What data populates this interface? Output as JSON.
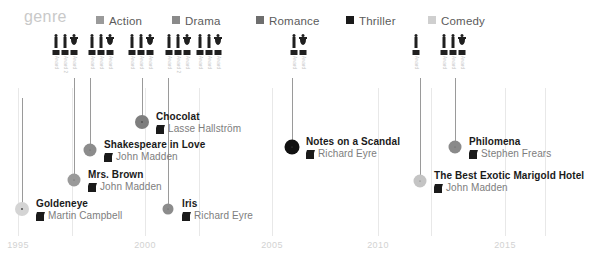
{
  "legend": {
    "title": "genre",
    "items": [
      {
        "label": "Action",
        "color": "#9a9a9a",
        "x": 96
      },
      {
        "label": "Drama",
        "color": "#8a8a8a",
        "x": 172
      },
      {
        "label": "Romance",
        "color": "#6e6e6e",
        "x": 256
      },
      {
        "label": "Thriller",
        "color": "#1a1a1a",
        "x": 346
      },
      {
        "label": "Comedy",
        "color": "#cfcfcf",
        "x": 428
      }
    ]
  },
  "axis": {
    "ticks": [
      {
        "label": "1995",
        "x": 18
      },
      {
        "label": "2000",
        "x": 145
      },
      {
        "label": "2005",
        "x": 272
      },
      {
        "label": "2010",
        "x": 378
      },
      {
        "label": "2015",
        "x": 505
      }
    ],
    "gridlines": [
      18,
      72,
      145,
      199,
      272,
      378,
      431,
      505,
      545
    ]
  },
  "award_groups": [
    {
      "x": 52,
      "count": 3,
      "labels": [
        "Award",
        "Award 2",
        "Award"
      ]
    },
    {
      "x": 88,
      "count": 3,
      "labels": [
        "Award",
        "Award",
        "Award"
      ]
    },
    {
      "x": 128,
      "count": 3,
      "labels": [
        "Award",
        "Award",
        "Award"
      ]
    },
    {
      "x": 165,
      "count": 3,
      "labels": [
        "Award",
        "Award 2",
        "Award"
      ]
    },
    {
      "x": 196,
      "count": 3,
      "labels": [
        "Award",
        "Award",
        "Award"
      ]
    },
    {
      "x": 290,
      "count": 2,
      "labels": [
        "Award",
        "Award"
      ]
    },
    {
      "x": 412,
      "count": 1,
      "labels": [
        "Award"
      ]
    },
    {
      "x": 440,
      "count": 3,
      "labels": [
        "Award",
        "Award",
        "Award"
      ]
    }
  ],
  "films": [
    {
      "title": "Chocolat",
      "director": "Lasse Hallström",
      "dot_x": 142,
      "dot_y": 122,
      "dot_size": 14,
      "dot_color": "#7e7e7e",
      "stem_x": 142,
      "stem_top": 78,
      "stem_height": 44
    },
    {
      "title": "Shakespeare in Love",
      "director": "John Madden",
      "dot_x": 90,
      "dot_y": 150,
      "dot_size": 13,
      "dot_color": "#8c8c8c",
      "stem_x": 90,
      "stem_top": 78,
      "stem_height": 72
    },
    {
      "title": "Mrs. Brown",
      "director": "John Madden",
      "dot_x": 74,
      "dot_y": 180,
      "dot_size": 13,
      "dot_color": "#9a9a9a",
      "stem_x": 74,
      "stem_top": 78,
      "stem_height": 102
    },
    {
      "title": "Goldeneye",
      "director": "Martin Campbell",
      "dot_x": 22,
      "dot_y": 209,
      "dot_size": 14,
      "dot_color": "#d4d4d4",
      "stem_x": 22,
      "stem_top": 98,
      "stem_height": 111
    },
    {
      "title": "Iris",
      "director": "Richard Eyre",
      "dot_x": 168,
      "dot_y": 209,
      "dot_size": 11,
      "dot_color": "#8c8c8c",
      "stem_x": 168,
      "stem_top": 78,
      "stem_height": 131
    },
    {
      "title": "Notes on a Scandal",
      "director": "Richard Eyre",
      "dot_x": 292,
      "dot_y": 147,
      "dot_size": 15,
      "dot_color": "#111111",
      "stem_x": 292,
      "stem_top": 78,
      "stem_height": 69
    },
    {
      "title": "Philomena",
      "director": "Stephen Frears",
      "dot_x": 455,
      "dot_y": 147,
      "dot_size": 13,
      "dot_color": "#8a8a8a",
      "stem_x": 455,
      "stem_top": 78,
      "stem_height": 69
    },
    {
      "title": "The Best Exotic Marigold Hotel",
      "director": "John Madden",
      "dot_x": 420,
      "dot_y": 181,
      "dot_size": 13,
      "dot_color": "#c4c4c4",
      "stem_x": 420,
      "stem_top": 78,
      "stem_height": 103
    }
  ],
  "chart_data": {
    "type": "scatter",
    "title": "genre",
    "xlabel": "",
    "ylabel": "",
    "xlim": [
      1994,
      2017
    ],
    "grid": true,
    "legend_position": "top",
    "categories": [
      "Action",
      "Drama",
      "Romance",
      "Thriller",
      "Comedy"
    ],
    "points": [
      {
        "label": "Goldeneye",
        "director": "Martin Campbell",
        "year": 1995,
        "genre": "Comedy",
        "awards": 0
      },
      {
        "label": "Mrs. Brown",
        "director": "John Madden",
        "year": 1997,
        "genre": "Action",
        "awards": 3
      },
      {
        "label": "Shakespeare in Love",
        "director": "John Madden",
        "year": 1998,
        "genre": "Drama",
        "awards": 3
      },
      {
        "label": "Chocolat",
        "director": "Lasse Hallström",
        "year": 2000,
        "genre": "Romance",
        "awards": 3
      },
      {
        "label": "Iris",
        "director": "Richard Eyre",
        "year": 2001,
        "genre": "Drama",
        "awards": 3
      },
      {
        "label": "Notes on a Scandal",
        "director": "Richard Eyre",
        "year": 2006,
        "genre": "Thriller",
        "awards": 2
      },
      {
        "label": "The Best Exotic Marigold Hotel",
        "director": "John Madden",
        "year": 2011,
        "genre": "Comedy",
        "awards": 1
      },
      {
        "label": "Philomena",
        "director": "Stephen Frears",
        "year": 2013,
        "genre": "Drama",
        "awards": 3
      }
    ]
  }
}
